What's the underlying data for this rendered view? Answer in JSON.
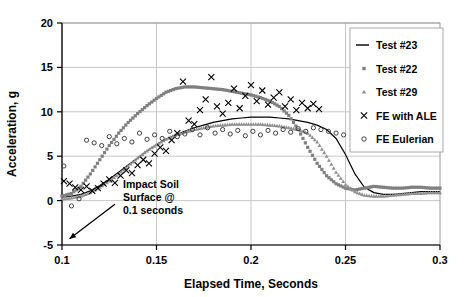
{
  "chart_data": {
    "type": "line",
    "title": "",
    "xlabel": "Elapsed Time, Seconds",
    "ylabel": "Acceleration, g",
    "xlim": [
      0.1,
      0.3
    ],
    "ylim": [
      -5,
      20
    ],
    "xticks": [
      0.1,
      0.15,
      0.2,
      0.25,
      0.3
    ],
    "xtick_labels": [
      "0.1",
      "0.15",
      "0.2",
      "0.25",
      "0.3"
    ],
    "yticks": [
      -5,
      0,
      5,
      10,
      15,
      20
    ],
    "ytick_labels": [
      "-5",
      "0",
      "5",
      "10",
      "15",
      "20"
    ],
    "grid": true,
    "legend_position": "top-right",
    "annotations": [
      {
        "name": "impact-soil-surface-note",
        "text_lines": [
          "Impact Soil",
          "Surface @",
          "0.1 seconds"
        ],
        "arrow_from": [
          0.128,
          -0.4
        ],
        "arrow_to": [
          0.104,
          -4.3
        ]
      }
    ],
    "series": [
      {
        "name": "Test #23",
        "marker": "line",
        "color": "#000000",
        "x": [
          0.1,
          0.105,
          0.11,
          0.115,
          0.12,
          0.125,
          0.13,
          0.135,
          0.14,
          0.145,
          0.15,
          0.155,
          0.16,
          0.165,
          0.17,
          0.175,
          0.18,
          0.185,
          0.19,
          0.195,
          0.2,
          0.205,
          0.21,
          0.215,
          0.22,
          0.225,
          0.23,
          0.235,
          0.24,
          0.245,
          0.25,
          0.255,
          0.26,
          0.265,
          0.27,
          0.275,
          0.28,
          0.285,
          0.29,
          0.295,
          0.3
        ],
        "y": [
          0.4,
          0.5,
          0.7,
          1.1,
          1.7,
          2.4,
          3.2,
          4.0,
          4.8,
          5.6,
          6.3,
          6.9,
          7.4,
          7.8,
          8.2,
          8.5,
          8.8,
          9.0,
          9.2,
          9.3,
          9.4,
          9.4,
          9.4,
          9.3,
          9.2,
          9.0,
          8.8,
          8.5,
          8.0,
          7.0,
          5.2,
          3.0,
          1.5,
          0.9,
          0.7,
          0.7,
          0.8,
          0.9,
          1.0,
          1.0,
          1.0
        ]
      },
      {
        "name": "Test #22",
        "marker": "square",
        "color": "#808080",
        "x": [
          0.1,
          0.105,
          0.11,
          0.115,
          0.12,
          0.125,
          0.13,
          0.135,
          0.14,
          0.145,
          0.15,
          0.155,
          0.16,
          0.165,
          0.17,
          0.175,
          0.18,
          0.185,
          0.19,
          0.195,
          0.2,
          0.205,
          0.21,
          0.215,
          0.22,
          0.225,
          0.23,
          0.235,
          0.24,
          0.245,
          0.25,
          0.255,
          0.26,
          0.265,
          0.27,
          0.275,
          0.28,
          0.285,
          0.29,
          0.295,
          0.3
        ],
        "y": [
          0.5,
          0.8,
          1.6,
          3.0,
          4.6,
          6.2,
          7.6,
          8.8,
          9.8,
          10.7,
          11.5,
          12.2,
          12.6,
          12.8,
          12.8,
          12.7,
          12.6,
          12.5,
          12.3,
          12.1,
          11.9,
          11.6,
          11.2,
          10.6,
          9.6,
          8.0,
          6.0,
          4.2,
          2.8,
          1.9,
          1.4,
          1.2,
          1.4,
          1.6,
          1.5,
          1.4,
          1.4,
          1.5,
          1.5,
          1.4,
          1.4
        ]
      },
      {
        "name": "Test #29",
        "marker": "triangle",
        "color": "#909090",
        "x": [
          0.1,
          0.105,
          0.11,
          0.115,
          0.12,
          0.125,
          0.13,
          0.135,
          0.14,
          0.145,
          0.15,
          0.155,
          0.16,
          0.165,
          0.17,
          0.175,
          0.18,
          0.185,
          0.19,
          0.195,
          0.2,
          0.205,
          0.21,
          0.215,
          0.22,
          0.225,
          0.23,
          0.235,
          0.24,
          0.245,
          0.25,
          0.255,
          0.26,
          0.265,
          0.27,
          0.275,
          0.28,
          0.285,
          0.29,
          0.295,
          0.3
        ],
        "y": [
          0.2,
          0.3,
          0.5,
          0.9,
          1.5,
          2.2,
          3.0,
          3.9,
          4.8,
          5.6,
          6.3,
          6.9,
          7.4,
          7.7,
          8.0,
          8.2,
          8.4,
          8.5,
          8.6,
          8.6,
          8.6,
          8.6,
          8.5,
          8.4,
          8.2,
          8.0,
          7.6,
          6.6,
          5.0,
          3.2,
          1.8,
          1.0,
          0.6,
          0.5,
          0.5,
          0.6,
          0.7,
          0.8,
          0.8,
          0.9,
          0.9
        ]
      },
      {
        "name": "FE with ALE",
        "marker": "x",
        "color": "#000000",
        "x": [
          0.101,
          0.104,
          0.107,
          0.11,
          0.113,
          0.116,
          0.119,
          0.122,
          0.125,
          0.128,
          0.131,
          0.134,
          0.137,
          0.14,
          0.143,
          0.146,
          0.149,
          0.152,
          0.155,
          0.158,
          0.161,
          0.164,
          0.167,
          0.17,
          0.173,
          0.176,
          0.179,
          0.182,
          0.185,
          0.188,
          0.191,
          0.194,
          0.197,
          0.2,
          0.203,
          0.206,
          0.209,
          0.212,
          0.215,
          0.218,
          0.221,
          0.224,
          0.227,
          0.23,
          0.233,
          0.236
        ],
        "y": [
          2.2,
          1.9,
          1.5,
          1.2,
          1.6,
          1.1,
          1.4,
          1.9,
          2.4,
          2.0,
          2.8,
          3.4,
          3.1,
          4.0,
          4.6,
          4.2,
          5.3,
          6.0,
          5.6,
          6.8,
          7.6,
          13.4,
          9.0,
          8.6,
          10.2,
          11.4,
          13.9,
          10.6,
          9.8,
          11.0,
          12.6,
          10.4,
          11.8,
          13.0,
          11.2,
          12.4,
          10.8,
          11.6,
          12.2,
          10.6,
          11.4,
          10.2,
          11.0,
          10.4,
          10.9,
          10.3
        ]
      },
      {
        "name": "FE Eulerian",
        "marker": "circle",
        "color": "#404040",
        "x": [
          0.101,
          0.105,
          0.109,
          0.113,
          0.117,
          0.121,
          0.125,
          0.129,
          0.133,
          0.137,
          0.141,
          0.145,
          0.149,
          0.153,
          0.157,
          0.161,
          0.165,
          0.169,
          0.173,
          0.177,
          0.181,
          0.185,
          0.189,
          0.193,
          0.197,
          0.201,
          0.205,
          0.209,
          0.213,
          0.217,
          0.221,
          0.225,
          0.229,
          0.233,
          0.237,
          0.241,
          0.245,
          0.249
        ],
        "y": [
          3.9,
          -0.6,
          0.2,
          6.8,
          6.5,
          6.2,
          7.2,
          6.4,
          7.0,
          6.6,
          7.6,
          6.9,
          7.4,
          7.0,
          7.8,
          7.2,
          7.5,
          8.0,
          7.4,
          8.2,
          7.6,
          8.0,
          7.5,
          7.9,
          7.3,
          7.8,
          7.4,
          7.9,
          7.6,
          8.0,
          7.7,
          8.1,
          7.8,
          8.2,
          8.0,
          7.8,
          7.6,
          7.4
        ]
      }
    ]
  },
  "legend": {
    "entries": [
      {
        "label": "Test #23",
        "marker": "line"
      },
      {
        "label": "Test #22",
        "marker": "square"
      },
      {
        "label": "Test #29",
        "marker": "triangle"
      },
      {
        "label": "FE with ALE",
        "marker": "x"
      },
      {
        "label": "FE Eulerian",
        "marker": "circle"
      }
    ]
  }
}
